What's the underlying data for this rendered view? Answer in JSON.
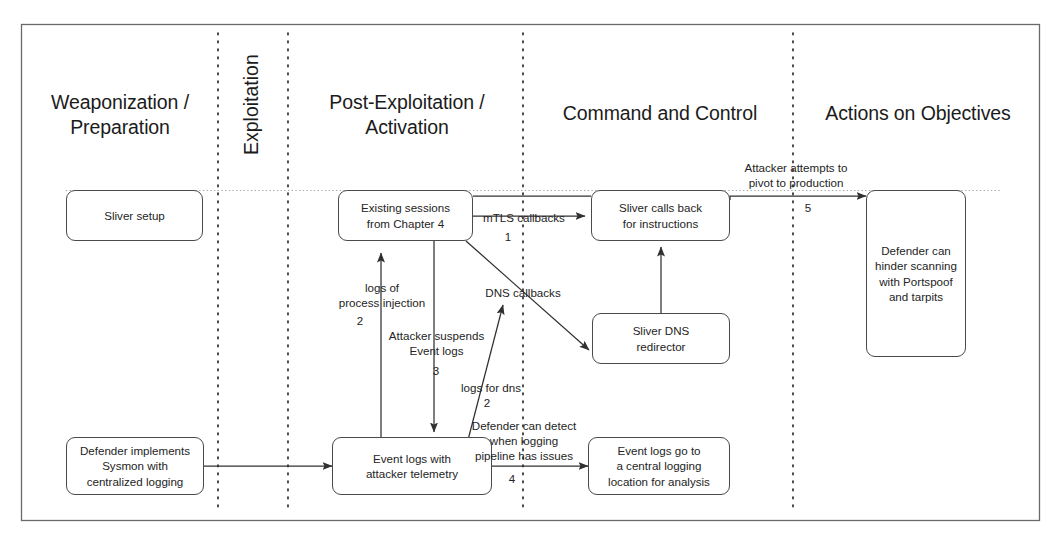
{
  "figure": {
    "background_color": "#ffffff",
    "line_color": "#4a4a4a",
    "text_color": "#242424"
  },
  "lanes": [
    {
      "id": "weaponization",
      "label": "Weaponization /\nPreparation",
      "orientation": "horizontal"
    },
    {
      "id": "exploitation",
      "label": "Exploitation",
      "orientation": "vertical"
    },
    {
      "id": "post-exploitation",
      "label": "Post-Exploitation /\nActivation",
      "orientation": "horizontal"
    },
    {
      "id": "command-and-control",
      "label": "Command and Control",
      "orientation": "horizontal"
    },
    {
      "id": "actions-on-objectives",
      "label": "Actions on Objectives",
      "orientation": "horizontal"
    }
  ],
  "nodes": [
    {
      "id": "sliver-setup",
      "label": "Sliver setup",
      "lane": "weaponization"
    },
    {
      "id": "existing-sessions",
      "label": "Existing sessions\nfrom Chapter 4",
      "lane": "post-exploitation"
    },
    {
      "id": "sliver-calls-back",
      "label": "Sliver calls back\nfor instructions",
      "lane": "command-and-control"
    },
    {
      "id": "sliver-dns-redirector",
      "label": "Sliver DNS\nredirector",
      "lane": "command-and-control"
    },
    {
      "id": "defender-portspoof",
      "label": "Defender can\nhinder scanning\nwith Portspoof\nand tarpits",
      "lane": "actions-on-objectives"
    },
    {
      "id": "defender-sysmon",
      "label": "Defender implements\nSysmon with\ncentralized logging",
      "lane": "weaponization"
    },
    {
      "id": "event-logs-telemetry",
      "label": "Event logs with\nattacker telemetry",
      "lane": "post-exploitation"
    },
    {
      "id": "central-logging",
      "label": "Event logs go to\na central logging\nlocation for analysis",
      "lane": "command-and-control"
    }
  ],
  "edges": [
    {
      "id": "mtls",
      "label": "mTLS callbacks",
      "step": "1",
      "from": "existing-sessions",
      "to": "sliver-calls-back"
    },
    {
      "id": "pivot",
      "label": "Attacker attempts to\npivot to production",
      "step": "5",
      "from": "sliver-calls-back",
      "to": "defender-portspoof"
    },
    {
      "id": "dns-callbacks",
      "label": "DNS callbacks",
      "step": "",
      "from": "existing-sessions",
      "to": "sliver-dns-redirector"
    },
    {
      "id": "process-injection-logs",
      "label": "logs of\nprocess injection",
      "step": "2",
      "from": "event-logs-telemetry",
      "to": "existing-sessions"
    },
    {
      "id": "suspend-event-logs",
      "label": "Attacker suspends\nEvent logs",
      "step": "3",
      "from": "existing-sessions",
      "to": "event-logs-telemetry"
    },
    {
      "id": "logs-for-dns",
      "label": "logs for dns",
      "step": "2",
      "from": "event-logs-telemetry",
      "to": "dns-callbacks"
    },
    {
      "id": "logging-pipeline",
      "label": "Defender can detect\nwhen logging\npipeline has issues",
      "step": "4",
      "from": "event-logs-telemetry",
      "to": "central-logging"
    },
    {
      "id": "sysmon-to-telemetry",
      "label": "",
      "step": "",
      "from": "defender-sysmon",
      "to": "event-logs-telemetry"
    }
  ]
}
